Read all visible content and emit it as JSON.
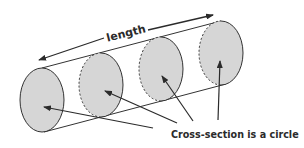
{
  "diagram": {
    "length_label": "length",
    "caption": "Cross-section is a circle",
    "colors": {
      "fill": "#d6d6d6",
      "stroke": "#333333",
      "text": "#2b2b2b",
      "background": "#ffffff"
    },
    "cross_sections": [
      {
        "id": 1,
        "cx": 42,
        "cy": 100,
        "rx": 22,
        "ry": 32,
        "back_edge": "solid"
      },
      {
        "id": 2,
        "cx": 101,
        "cy": 85,
        "rx": 22,
        "ry": 32,
        "back_edge": "dashed"
      },
      {
        "id": 3,
        "cx": 161,
        "cy": 69,
        "rx": 22,
        "ry": 32,
        "back_edge": "dashed"
      },
      {
        "id": 4,
        "cx": 221,
        "cy": 53,
        "rx": 22,
        "ry": 32,
        "back_edge": "dashed"
      }
    ],
    "pointer_arrows": 4
  }
}
